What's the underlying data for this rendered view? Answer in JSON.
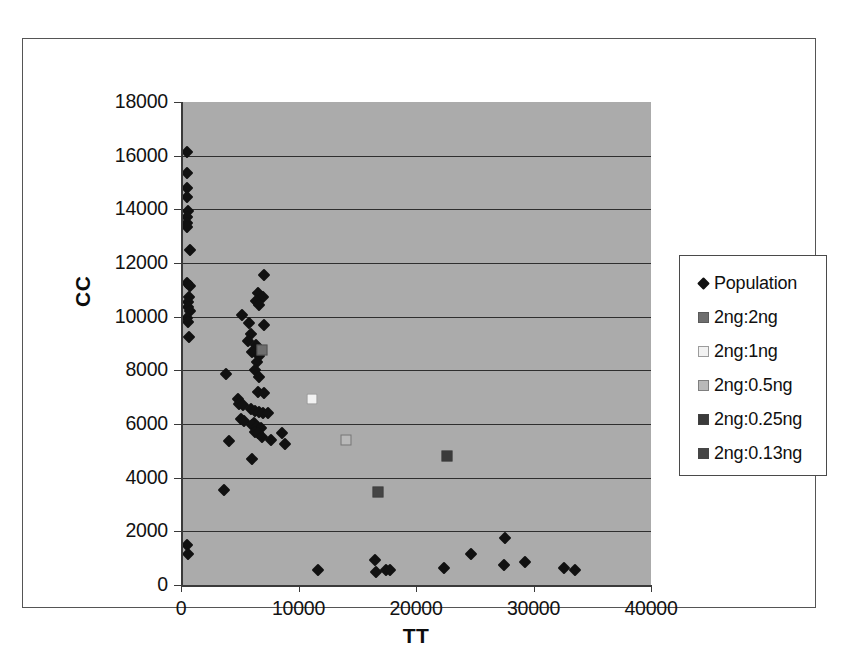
{
  "chart_data": {
    "type": "scatter",
    "title": "",
    "xlabel": "TT",
    "ylabel": "CC",
    "xlim": [
      0,
      40000
    ],
    "ylim": [
      0,
      18000
    ],
    "xticks": [
      0,
      10000,
      20000,
      30000,
      40000
    ],
    "yticks": [
      0,
      2000,
      4000,
      6000,
      8000,
      10000,
      12000,
      14000,
      16000,
      18000
    ],
    "xtick_labels": [
      "0",
      "10000",
      "20000",
      "30000",
      "40000"
    ],
    "ytick_labels": [
      "0",
      "2000",
      "4000",
      "6000",
      "8000",
      "10000",
      "12000",
      "14000",
      "16000",
      "18000"
    ],
    "grid": "horizontal",
    "legend_position": "right",
    "plot_background": "#ababab",
    "series": [
      {
        "name": "Population",
        "marker": "diamond",
        "color": "#111111",
        "points": [
          [
            300,
            16150
          ],
          [
            350,
            15350
          ],
          [
            300,
            14800
          ],
          [
            350,
            14450
          ],
          [
            400,
            13950
          ],
          [
            350,
            13700
          ],
          [
            330,
            13500
          ],
          [
            380,
            13350
          ],
          [
            600,
            12500
          ],
          [
            350,
            11250
          ],
          [
            600,
            11150
          ],
          [
            500,
            10750
          ],
          [
            400,
            10550
          ],
          [
            450,
            10350
          ],
          [
            600,
            10200
          ],
          [
            350,
            9950
          ],
          [
            400,
            9800
          ],
          [
            550,
            9250
          ],
          [
            6900,
            11550
          ],
          [
            6400,
            10900
          ],
          [
            6800,
            10750
          ],
          [
            6200,
            10600
          ],
          [
            6500,
            10450
          ],
          [
            5000,
            10050
          ],
          [
            5600,
            9750
          ],
          [
            6900,
            9700
          ],
          [
            5800,
            9350
          ],
          [
            5500,
            9100
          ],
          [
            6200,
            8950
          ],
          [
            5900,
            8700
          ],
          [
            6500,
            8550
          ],
          [
            6300,
            8300
          ],
          [
            6100,
            8000
          ],
          [
            6500,
            7750
          ],
          [
            3700,
            7850
          ],
          [
            6400,
            7200
          ],
          [
            6900,
            7150
          ],
          [
            4700,
            6950
          ],
          [
            4800,
            6750
          ],
          [
            5100,
            6700
          ],
          [
            5800,
            6550
          ],
          [
            6100,
            6500
          ],
          [
            6500,
            6450
          ],
          [
            6800,
            6400
          ],
          [
            7200,
            6400
          ],
          [
            4900,
            6200
          ],
          [
            5200,
            6100
          ],
          [
            6000,
            6050
          ],
          [
            5900,
            5950
          ],
          [
            6300,
            5900
          ],
          [
            6600,
            5850
          ],
          [
            6100,
            5700
          ],
          [
            6400,
            5650
          ],
          [
            8400,
            5650
          ],
          [
            6700,
            5500
          ],
          [
            7500,
            5400
          ],
          [
            3900,
            5350
          ],
          [
            8700,
            5250
          ],
          [
            5900,
            4700
          ],
          [
            3500,
            3550
          ],
          [
            350,
            1500
          ],
          [
            400,
            1150
          ],
          [
            11500,
            550
          ],
          [
            16300,
            950
          ],
          [
            16400,
            500
          ],
          [
            17300,
            550
          ],
          [
            17600,
            550
          ],
          [
            22200,
            650
          ],
          [
            24500,
            1150
          ],
          [
            27400,
            1750
          ],
          [
            27300,
            750
          ],
          [
            29100,
            850
          ],
          [
            32400,
            650
          ],
          [
            33400,
            550
          ]
        ]
      },
      {
        "name": "2ng:2ng",
        "marker": "square",
        "color": "#6e6e6e",
        "points": [
          [
            6750,
            8750
          ]
        ]
      },
      {
        "name": "2ng:1ng",
        "marker": "square",
        "color": "#f2f2f2",
        "points": [
          [
            11000,
            6950
          ]
        ]
      },
      {
        "name": "2ng:0.5ng",
        "marker": "square",
        "color": "#b9b9b9",
        "points": [
          [
            13900,
            5400
          ]
        ]
      },
      {
        "name": "2ng:0.25ng",
        "marker": "square",
        "color": "#3a3a3a",
        "points": [
          [
            22500,
            4800
          ]
        ]
      },
      {
        "name": "2ng:0.13ng",
        "marker": "square",
        "color": "#454545",
        "points": [
          [
            16600,
            3450
          ]
        ]
      }
    ]
  },
  "legend": {
    "items": [
      {
        "label": "Population",
        "marker": "diamond",
        "color": "#111111"
      },
      {
        "label": "2ng:2ng",
        "marker": "square",
        "color": "#6e6e6e"
      },
      {
        "label": "2ng:1ng",
        "marker": "square",
        "color": "#f2f2f2"
      },
      {
        "label": "2ng:0.5ng",
        "marker": "square",
        "color": "#b9b9b9"
      },
      {
        "label": "2ng:0.25ng",
        "marker": "square",
        "color": "#3a3a3a"
      },
      {
        "label": "2ng:0.13ng",
        "marker": "square",
        "color": "#454545"
      }
    ]
  }
}
